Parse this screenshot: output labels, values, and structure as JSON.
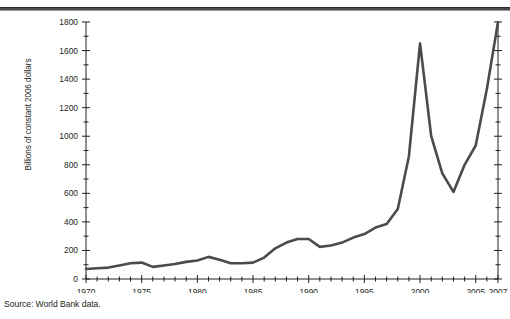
{
  "figure": {
    "source_note": "Source: World Bank data.",
    "top_rule_color": "#4a4a4f"
  },
  "chart_data": {
    "type": "line",
    "title": "",
    "subtitle": "",
    "xlabel": "",
    "ylabel": "Billions of constant 2006 dollars",
    "xlim": [
      1970,
      2007
    ],
    "ylim": [
      0,
      1800
    ],
    "grid": false,
    "legend": "none",
    "line_color": "#4a4a4f",
    "line_width_px": 2.6,
    "y_ticks_major": [
      0,
      200,
      400,
      600,
      800,
      1000,
      1200,
      1400,
      1600,
      1800
    ],
    "y_ticks_minor_step": 100,
    "x_ticks_major": [
      1970,
      1975,
      1980,
      1985,
      1990,
      1995,
      2000,
      2005,
      2007
    ],
    "x_ticks_minor_step": 1,
    "x_tick_labels": [
      "1970",
      "1975",
      "1980",
      "1985",
      "1990",
      "1995",
      "2000",
      "2005",
      "2007"
    ],
    "y_tick_labels": [
      "0",
      "200",
      "400",
      "600",
      "800",
      "1000",
      "1200",
      "1400",
      "1600",
      "1800"
    ],
    "x": [
      1970,
      1971,
      1972,
      1973,
      1974,
      1975,
      1976,
      1977,
      1978,
      1979,
      1980,
      1981,
      1982,
      1983,
      1984,
      1985,
      1986,
      1987,
      1988,
      1989,
      1990,
      1991,
      1992,
      1993,
      1994,
      1995,
      1996,
      1997,
      1998,
      1999,
      2000,
      2001,
      2002,
      2003,
      2004,
      2005,
      2006,
      2007
    ],
    "values": [
      70,
      75,
      80,
      95,
      110,
      115,
      85,
      95,
      105,
      120,
      130,
      155,
      135,
      110,
      110,
      115,
      150,
      215,
      255,
      280,
      280,
      225,
      235,
      255,
      290,
      315,
      360,
      385,
      490,
      860,
      1650,
      1000,
      740,
      610,
      800,
      935,
      1330,
      1800
    ],
    "series": [
      {
        "name": "Global flows",
        "values": [
          70,
          75,
          80,
          95,
          110,
          115,
          85,
          95,
          105,
          120,
          130,
          155,
          135,
          110,
          110,
          115,
          150,
          215,
          255,
          280,
          280,
          225,
          235,
          255,
          290,
          315,
          360,
          385,
          490,
          860,
          1650,
          1000,
          740,
          610,
          800,
          935,
          1330,
          1800
        ]
      }
    ],
    "annotations": []
  }
}
